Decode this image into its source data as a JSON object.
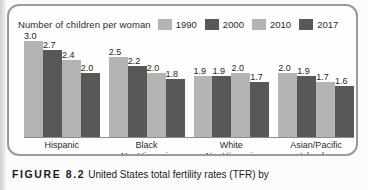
{
  "figure": {
    "number_label": "FIGURE 8.2",
    "caption_text": "United States total fertility rates (TFR) by"
  },
  "chart_data": {
    "type": "bar",
    "title": "Number of children per woman",
    "xlabel": "",
    "ylabel": "Number of children per woman",
    "ylim": [
      0,
      3.2
    ],
    "grid": false,
    "legend_position": "top-right",
    "categories": [
      "Hispanic",
      "Black NonHispanic",
      "White NonHispanic",
      "Asian/Pacific Islander"
    ],
    "category_lines": [
      [
        "Hispanic",
        ""
      ],
      [
        "Black",
        "NonHispanic"
      ],
      [
        "White",
        "NonHispanic"
      ],
      [
        "Asian/Pacific",
        "Islander"
      ]
    ],
    "series": [
      {
        "name": "1990",
        "color": "#b4b4b2",
        "values": [
          3.0,
          2.5,
          1.9,
          2.0
        ]
      },
      {
        "name": "2000",
        "color": "#585856",
        "values": [
          2.7,
          2.2,
          1.9,
          1.9
        ]
      },
      {
        "name": "2010",
        "color": "#b4b4b2",
        "values": [
          2.4,
          2.0,
          2.0,
          1.7
        ]
      },
      {
        "name": "2017",
        "color": "#585856",
        "values": [
          2.0,
          1.8,
          1.7,
          1.6
        ]
      }
    ],
    "value_labels": [
      [
        "3.0",
        "2.7",
        "2.4",
        "2.0"
      ],
      [
        "2.5",
        "2.2",
        "2.0",
        "1.8"
      ],
      [
        "1.9",
        "1.9",
        "2.0",
        "1.7"
      ],
      [
        "2.0",
        "1.9",
        "1.7",
        "1.6"
      ]
    ]
  },
  "legend": {
    "items": [
      {
        "label": "1990",
        "color": "#b4b4b2"
      },
      {
        "label": "2000",
        "color": "#585856"
      },
      {
        "label": "2010",
        "color": "#b4b4b2"
      },
      {
        "label": "2017",
        "color": "#585856"
      }
    ]
  },
  "colors": {
    "light_bar": "#b4b4b2",
    "dark_bar": "#585856",
    "frame_border": "#9a9a98",
    "axis": "#8d8d8b",
    "text": "#2b2b2b"
  }
}
